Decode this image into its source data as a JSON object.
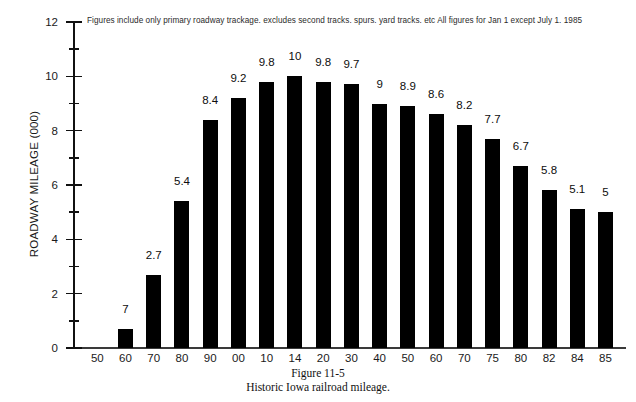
{
  "chart_data": {
    "type": "bar",
    "title": "",
    "note": "Figures include only primary roadway trackage. excludes second tracks. spurs. yard tracks. etc  All figures for Jan  1 except July 1. 1985",
    "xlabel": "",
    "ylabel": "ROADWAY MILEAGE (000)",
    "ylim": [
      0,
      12
    ],
    "grid": false,
    "legend": null,
    "y_ticks": [
      0,
      2,
      4,
      6,
      8,
      10,
      12
    ],
    "y_minor_ticks": [
      1,
      3,
      5,
      7,
      9,
      11
    ],
    "categories": [
      "50",
      "60",
      "70",
      "80",
      "90",
      "00",
      "10",
      "14",
      "20",
      "30",
      "40",
      "50",
      "60",
      "70",
      "75",
      "80",
      "82",
      "84",
      "85"
    ],
    "values": [
      0,
      0.7,
      2.7,
      5.4,
      8.4,
      9.2,
      9.8,
      10,
      9.8,
      9.7,
      9,
      8.9,
      8.6,
      8.2,
      7.7,
      6.7,
      5.8,
      5.1,
      5
    ],
    "data_labels": [
      "",
      "7",
      "2.7",
      "5.4",
      "8.4",
      "9.2",
      "9.8",
      "10",
      "9.8",
      "9.7",
      "9",
      "8.9",
      "8.6",
      "8.2",
      "7.7",
      "6.7",
      "5.8",
      "5.1",
      "5"
    ],
    "bar_color": "#000000"
  },
  "caption": {
    "figure_number": "Figure 11-5",
    "figure_title": "Historic Iowa railroad mileage."
  }
}
